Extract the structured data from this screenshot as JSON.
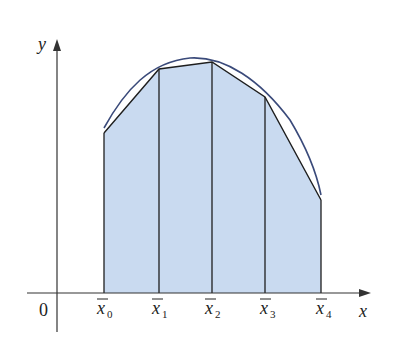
{
  "figure": {
    "axes": {
      "x_label": "x",
      "y_label": "y",
      "origin_label": "0"
    },
    "partition": {
      "labels": [
        {
          "base": "x",
          "sub": "0"
        },
        {
          "base": "x",
          "sub": "1"
        },
        {
          "base": "x",
          "sub": "2"
        },
        {
          "base": "x",
          "sub": "3"
        },
        {
          "base": "x",
          "sub": "4"
        }
      ],
      "x_px": [
        104,
        159,
        212,
        265,
        321
      ],
      "y_px": [
        133,
        69,
        62,
        97,
        200
      ]
    },
    "colors": {
      "fill": "#c9daf0",
      "curve": "#3a4a7a",
      "lines": "#1e1e1e",
      "axis": "#333333"
    }
  }
}
